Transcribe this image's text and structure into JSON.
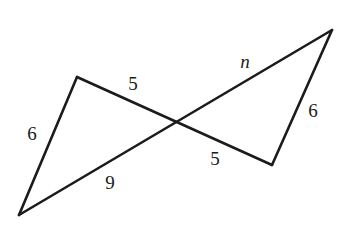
{
  "figure": {
    "canvas": {
      "width": 348,
      "height": 228
    },
    "stroke_color": "#1b1b1b",
    "background_color": "#ffffff",
    "stroke_width": 2.6,
    "vertices": {
      "left_apex": {
        "x": 77,
        "y": 77
      },
      "bottom_left": {
        "x": 19,
        "y": 215
      },
      "top_right": {
        "x": 332,
        "y": 30
      },
      "bottom_right": {
        "x": 272,
        "y": 165
      },
      "crossing": {
        "x": 172,
        "y": 122
      }
    },
    "segments": [
      {
        "name": "left-short-side",
        "from": "left_apex",
        "to": "bottom_left",
        "label": "6"
      },
      {
        "name": "long-upper-diagonal",
        "from": "left_apex",
        "to": "bottom_right",
        "label_upper": "5",
        "label_lower": "5"
      },
      {
        "name": "long-lower-diagonal",
        "from": "bottom_left",
        "to": "top_right",
        "label_lower": "9",
        "label_upper": "n"
      },
      {
        "name": "right-short-side",
        "from": "top_right",
        "to": "bottom_right",
        "label": "6"
      }
    ],
    "labels": [
      {
        "name": "label-6-left",
        "text": "6",
        "x": 32,
        "y": 133,
        "italic": false
      },
      {
        "name": "label-5-upper",
        "text": "5",
        "x": 133,
        "y": 83,
        "italic": false
      },
      {
        "name": "label-n",
        "text": "n",
        "x": 245,
        "y": 61,
        "italic": true
      },
      {
        "name": "label-6-right",
        "text": "6",
        "x": 313,
        "y": 110,
        "italic": false
      },
      {
        "name": "label-5-lower",
        "text": "5",
        "x": 215,
        "y": 158,
        "italic": false
      },
      {
        "name": "label-9",
        "text": "9",
        "x": 110,
        "y": 182,
        "italic": false
      }
    ]
  }
}
